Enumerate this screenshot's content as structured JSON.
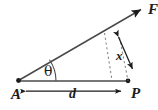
{
  "figure": {
    "background_color": "#ffffff",
    "stroke_color": "#1b1b1b",
    "width": 158,
    "height": 110,
    "labels": {
      "point_a": "A",
      "point_p": "P",
      "force_vector": "F",
      "baseline_distance": "d",
      "perpendicular_distance": "x",
      "angle": "θ"
    },
    "elements": {
      "ray_name": "force-ray-AF",
      "baseline_name": "baseline-A-to-P",
      "dimension_d_name": "dimension-arrow-d",
      "dimension_x_name": "dimension-arrow-x",
      "angle_arc_name": "angle-arc-theta",
      "dashed_guide_1": "dashed-guide-left",
      "dashed_guide_2": "dashed-guide-right"
    },
    "geometry": {
      "point_a": [
        18,
        81
      ],
      "point_p": [
        128,
        81
      ],
      "arrow_tip_f": [
        146,
        6
      ],
      "ray_angle_degrees": 34,
      "baseline_length_px": 110,
      "dimension_line_y": 91,
      "dashed_left_from": [
        105,
        33
      ],
      "dashed_left_to": [
        112,
        80
      ],
      "dashed_right_from": [
        119,
        38
      ],
      "dashed_right_to": [
        128,
        81
      ],
      "x_arrow_from": [
        118,
        36
      ],
      "x_arrow_to": [
        133,
        70
      ]
    }
  }
}
